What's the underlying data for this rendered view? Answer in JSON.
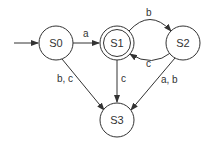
{
  "diagram": {
    "type": "finite-state-automaton",
    "states": [
      {
        "id": "S0",
        "label": "S0",
        "cx": 56,
        "cy": 43,
        "start": true,
        "accepting": false
      },
      {
        "id": "S1",
        "label": "S1",
        "cx": 117,
        "cy": 43,
        "start": false,
        "accepting": true
      },
      {
        "id": "S2",
        "label": "S2",
        "cx": 183,
        "cy": 43,
        "start": false,
        "accepting": false
      },
      {
        "id": "S3",
        "label": "S3",
        "cx": 117,
        "cy": 120,
        "start": false,
        "accepting": false
      }
    ],
    "transitions": [
      {
        "from": "S0",
        "to": "S1",
        "label": "a"
      },
      {
        "from": "S1",
        "to": "S2",
        "label": "b"
      },
      {
        "from": "S2",
        "to": "S1",
        "label": "c"
      },
      {
        "from": "S0",
        "to": "S3",
        "label": "b, c"
      },
      {
        "from": "S1",
        "to": "S3",
        "label": "c"
      },
      {
        "from": "S2",
        "to": "S3",
        "label": "a, b"
      }
    ],
    "colors": {
      "stroke": "#333333",
      "background": "#ffffff"
    }
  }
}
